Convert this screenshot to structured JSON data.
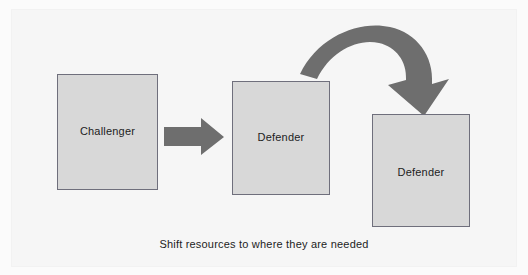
{
  "figure": {
    "caption": "Shift resources to where they are needed",
    "background_color": "#fbfbfb",
    "panel_color": "#f6f6f6"
  },
  "style": {
    "box_fill": "#d8d8d8",
    "box_border": "#6f6f7c",
    "arrow_fill": "#6e6e6e",
    "text_color": "#1d1d1d"
  },
  "nodes": [
    {
      "id": "challenger",
      "label": "Challenger"
    },
    {
      "id": "defender_mid",
      "label": "Defender"
    },
    {
      "id": "defender_right",
      "label": "Defender"
    }
  ],
  "arrows": [
    {
      "id": "straight-arrow",
      "from": "challenger",
      "to": "defender_mid",
      "shape": "straight-right-arrow"
    },
    {
      "id": "curved-arrow",
      "from": "defender_mid",
      "to": "defender_right",
      "shape": "curved-down-right-arrow"
    }
  ]
}
